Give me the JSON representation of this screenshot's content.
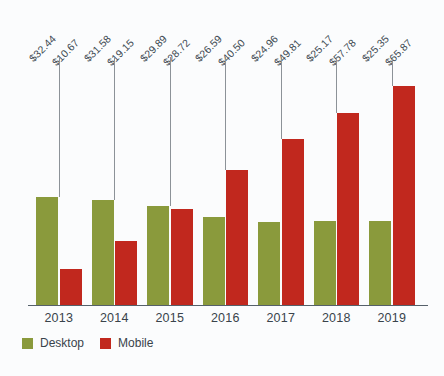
{
  "chart_data": {
    "type": "bar",
    "title": "",
    "subtitle": "",
    "xlabel": "",
    "ylabel": "",
    "ylim": [
      0,
      70
    ],
    "grid": false,
    "legend_position": "bottom-left",
    "categories": [
      "2013",
      "2014",
      "2015",
      "2016",
      "2017",
      "2018",
      "2019"
    ],
    "series": [
      {
        "name": "Desktop",
        "color": "#8a9a3c",
        "values": [
          32.44,
          31.58,
          29.89,
          26.59,
          24.96,
          25.17,
          25.35
        ],
        "labels": [
          "$32.44",
          "$31.58",
          "$29.89",
          "$26.59",
          "$24.96",
          "$25.17",
          "$25.35"
        ]
      },
      {
        "name": "Mobile",
        "color": "#c1281e",
        "values": [
          10.67,
          19.15,
          28.72,
          40.5,
          49.81,
          57.78,
          65.87
        ],
        "labels": [
          "$10.67",
          "$19.15",
          "$28.72",
          "$40.50",
          "$49.81",
          "$57.78",
          "$65.87"
        ]
      }
    ]
  },
  "legend": {
    "desktop_label": "Desktop",
    "mobile_label": "Mobile"
  },
  "axis": {
    "ticks": [
      "2013",
      "2014",
      "2015",
      "2016",
      "2017",
      "2018",
      "2019"
    ]
  }
}
